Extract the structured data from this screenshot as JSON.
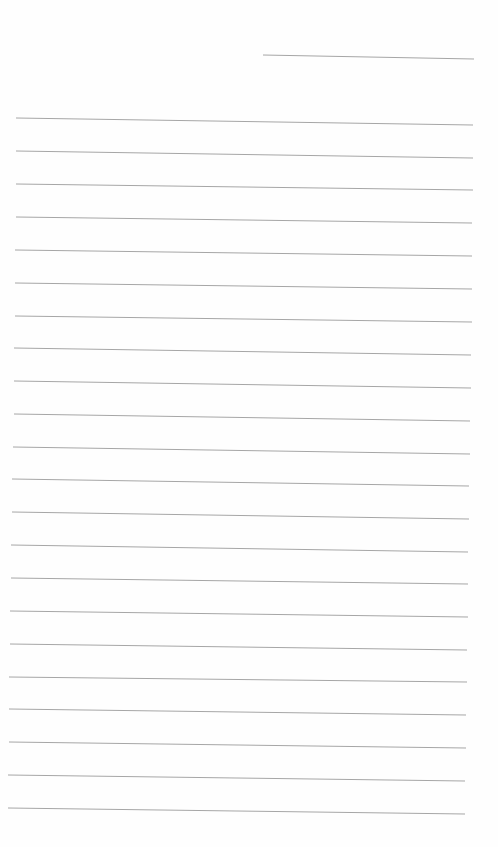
{
  "page": {
    "type": "lined-paper",
    "background": "#fefefe",
    "line_color": "#a6a6a6",
    "date_line": {
      "x1": 263,
      "y1": 55,
      "x2": 474,
      "y2": 59
    },
    "rule_lines": [
      {
        "x1": 16,
        "y1": 118,
        "x2": 473,
        "y2": 125
      },
      {
        "x1": 16,
        "y1": 151,
        "x2": 473,
        "y2": 158
      },
      {
        "x1": 16,
        "y1": 184,
        "x2": 473,
        "y2": 190
      },
      {
        "x1": 16,
        "y1": 217,
        "x2": 472,
        "y2": 223
      },
      {
        "x1": 15,
        "y1": 250,
        "x2": 472,
        "y2": 256
      },
      {
        "x1": 15,
        "y1": 283,
        "x2": 472,
        "y2": 289
      },
      {
        "x1": 15,
        "y1": 316,
        "x2": 472,
        "y2": 322
      },
      {
        "x1": 14,
        "y1": 348,
        "x2": 471,
        "y2": 355
      },
      {
        "x1": 14,
        "y1": 381,
        "x2": 471,
        "y2": 388
      },
      {
        "x1": 14,
        "y1": 414,
        "x2": 470,
        "y2": 421
      },
      {
        "x1": 13,
        "y1": 447,
        "x2": 470,
        "y2": 454
      },
      {
        "x1": 12,
        "y1": 479,
        "x2": 469,
        "y2": 486
      },
      {
        "x1": 12,
        "y1": 512,
        "x2": 469,
        "y2": 519
      },
      {
        "x1": 11,
        "y1": 545,
        "x2": 468,
        "y2": 552
      },
      {
        "x1": 11,
        "y1": 578,
        "x2": 468,
        "y2": 584
      },
      {
        "x1": 10,
        "y1": 611,
        "x2": 468,
        "y2": 617
      },
      {
        "x1": 10,
        "y1": 644,
        "x2": 467,
        "y2": 650
      },
      {
        "x1": 9,
        "y1": 677,
        "x2": 467,
        "y2": 682
      },
      {
        "x1": 9,
        "y1": 709,
        "x2": 466,
        "y2": 715
      },
      {
        "x1": 9,
        "y1": 742,
        "x2": 466,
        "y2": 748
      },
      {
        "x1": 8,
        "y1": 775,
        "x2": 465,
        "y2": 781
      },
      {
        "x1": 8,
        "y1": 808,
        "x2": 465,
        "y2": 814
      }
    ]
  }
}
